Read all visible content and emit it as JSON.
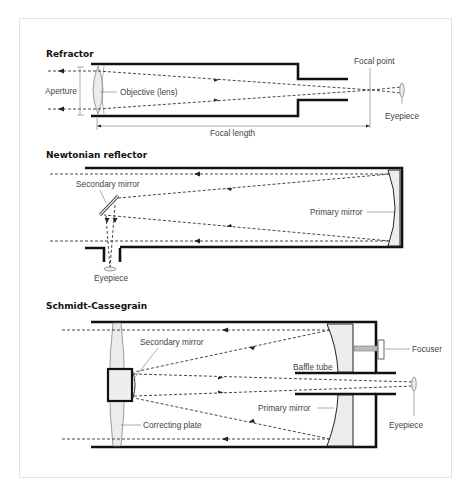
{
  "diagrams": {
    "refractor": {
      "title": "Refractor",
      "labels": {
        "aperture": "Aperture",
        "objective": "Objective (lens)",
        "focal_length": "Focal length",
        "focal_point": "Focal point",
        "eyepiece": "Eyepiece"
      }
    },
    "newtonian": {
      "title": "Newtonian reflector",
      "labels": {
        "secondary_mirror": "Secondary mirror",
        "primary_mirror": "Primary mirror",
        "eyepiece": "Eyepiece"
      }
    },
    "schmidt_cassegrain": {
      "title": "Schmidt-Cassegrain",
      "labels": {
        "secondary_mirror": "Secondary mirror",
        "focuser": "Focuser",
        "baffle_tube": "Baffle tube",
        "primary_mirror": "Primary mirror",
        "correcting_plate": "Correcting plate",
        "eyepiece": "Eyepiece"
      }
    }
  }
}
